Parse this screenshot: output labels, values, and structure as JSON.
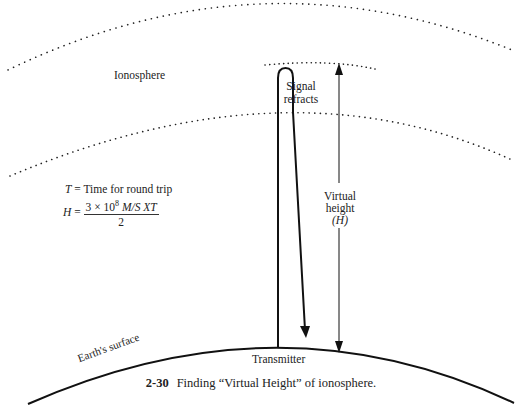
{
  "figure": {
    "number": "2-30",
    "caption": "Finding “Virtual Height” of ionosphere."
  },
  "labels": {
    "ionosphere": "Ionosphere",
    "signal_line1": "Signal",
    "signal_line2": "refracts",
    "virtual_line1": "Virtual",
    "virtual_line2": "height",
    "virtual_line3": "(H)",
    "earth_surface": "Earth's surface",
    "transmitter": "Transmitter"
  },
  "equations": {
    "t_var": "T",
    "t_def": " = Time for round trip",
    "h_var": "H",
    "h_eq": " = ",
    "h_numerator_text": "3 × 10",
    "h_numerator_exp": "8",
    "h_numerator_units": " M/S XT",
    "h_denominator": "2"
  },
  "colors": {
    "stroke": "#111111",
    "dots": "#222222",
    "background": "#ffffff"
  }
}
